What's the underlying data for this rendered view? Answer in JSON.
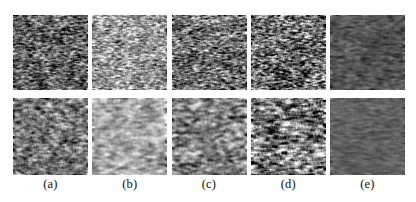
{
  "figure": {
    "type": "image-panel-grid",
    "rows": 2,
    "columns": 5,
    "background_color": "#ffffff",
    "panel_width_px": 75,
    "panel_height_px": 75,
    "caption_font_color": "#101010"
  },
  "captions": [
    {
      "label": "(a)"
    },
    {
      "label": "(b)"
    },
    {
      "label": "(c)"
    },
    {
      "label": "(d)"
    },
    {
      "label": "(e)"
    }
  ],
  "panels": [
    {
      "row": 0,
      "column": 0,
      "column_label": "(a)",
      "name": "panel-row1-a",
      "description": "grayscale ultrasound speckle texture, medium-dark, fine horizontal streaks",
      "mean_gray": 96,
      "contrast": 46,
      "grain_scale": 1.0,
      "streak_x": 3.1,
      "streak_y": 1.0,
      "blur": 0.35,
      "seed": 101
    },
    {
      "row": 0,
      "column": 1,
      "column_label": "(b)",
      "name": "panel-row1-b",
      "description": "grayscale speckle texture, bright, moderate contrast",
      "mean_gray": 150,
      "contrast": 44,
      "grain_scale": 1.05,
      "streak_x": 3.0,
      "streak_y": 1.0,
      "blur": 0.4,
      "seed": 202
    },
    {
      "row": 0,
      "column": 2,
      "column_label": "(c)",
      "name": "panel-row1-c",
      "description": "grayscale speckle texture, medium brightness, strong streaks",
      "mean_gray": 112,
      "contrast": 50,
      "grain_scale": 1.0,
      "streak_x": 3.4,
      "streak_y": 1.0,
      "blur": 0.35,
      "seed": 303
    },
    {
      "row": 0,
      "column": 3,
      "column_label": "(d)",
      "name": "panel-row1-d",
      "description": "grayscale speckle texture, high contrast, bright specular spots",
      "mean_gray": 108,
      "contrast": 60,
      "grain_scale": 0.95,
      "streak_x": 2.8,
      "streak_y": 1.0,
      "blur": 0.25,
      "seed": 404
    },
    {
      "row": 0,
      "column": 4,
      "column_label": "(e)",
      "name": "panel-row1-e",
      "description": "grayscale texture, dark and smooth, speckle strongly suppressed",
      "mean_gray": 84,
      "contrast": 20,
      "grain_scale": 1.2,
      "streak_x": 4.0,
      "streak_y": 1.1,
      "blur": 0.9,
      "seed": 505
    },
    {
      "row": 1,
      "column": 0,
      "column_label": "(a)",
      "name": "panel-row2-a",
      "description": "grayscale speckle texture, medium gray, softly blurred",
      "mean_gray": 118,
      "contrast": 38,
      "grain_scale": 1.4,
      "streak_x": 3.2,
      "streak_y": 1.1,
      "blur": 0.7,
      "seed": 606
    },
    {
      "row": 1,
      "column": 1,
      "column_label": "(b)",
      "name": "panel-row2-b",
      "description": "grayscale texture, bright and smooth, low contrast",
      "mean_gray": 168,
      "contrast": 32,
      "grain_scale": 1.6,
      "streak_x": 3.6,
      "streak_y": 1.2,
      "blur": 0.9,
      "seed": 707
    },
    {
      "row": 1,
      "column": 2,
      "column_label": "(c)",
      "name": "panel-row2-c",
      "description": "grayscale texture, medium gray with blotchy dark regions",
      "mean_gray": 128,
      "contrast": 44,
      "grain_scale": 1.5,
      "streak_x": 3.2,
      "streak_y": 1.2,
      "blur": 0.8,
      "seed": 808
    },
    {
      "row": 1,
      "column": 3,
      "column_label": "(d)",
      "name": "panel-row2-d",
      "description": "grayscale texture, strong dark-bright mottling, highest contrast",
      "mean_gray": 120,
      "contrast": 62,
      "grain_scale": 1.6,
      "streak_x": 3.0,
      "streak_y": 1.3,
      "blur": 0.7,
      "seed": 909
    },
    {
      "row": 1,
      "column": 4,
      "column_label": "(e)",
      "name": "panel-row2-e",
      "description": "grayscale texture, dark flat region, almost uniform",
      "mean_gray": 96,
      "contrast": 14,
      "grain_scale": 1.3,
      "streak_x": 4.5,
      "streak_y": 1.1,
      "blur": 1.0,
      "seed": 1010
    }
  ]
}
